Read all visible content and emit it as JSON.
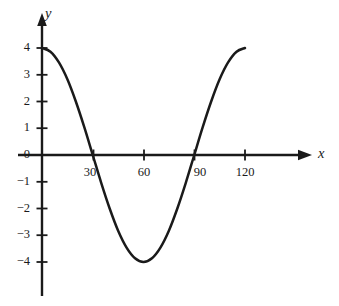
{
  "chart_data": {
    "type": "line",
    "title": "",
    "subtitle": "",
    "xlabel": "x",
    "ylabel": "y",
    "xlim": [
      -5,
      133
    ],
    "ylim": [
      -5.2,
      4.8
    ],
    "grid": false,
    "legend": null,
    "annotations": [],
    "x_ticks": [
      30,
      60,
      90,
      120
    ],
    "x_tick_labels": [
      "30",
      "60",
      "90",
      "120"
    ],
    "y_ticks": [
      4,
      3,
      2,
      1,
      0,
      -1,
      -2,
      -3,
      -4
    ],
    "y_tick_labels": [
      "4",
      "3",
      "2",
      "1",
      "0",
      "−1",
      "−2",
      "−3",
      "−4"
    ],
    "curve_expression": "y = 4 cos(3x)",
    "x": [
      0,
      5,
      10,
      15,
      20,
      25,
      30,
      35,
      40,
      45,
      50,
      55,
      60,
      65,
      70,
      75,
      80,
      85,
      90,
      95,
      100,
      105,
      110,
      115,
      120
    ],
    "values": [
      4.0,
      3.86,
      3.46,
      2.83,
      2.0,
      1.04,
      0.0,
      -1.04,
      -2.0,
      -2.83,
      -3.46,
      -3.86,
      -4.0,
      -3.86,
      -3.46,
      -2.83,
      -2.0,
      -1.04,
      0.0,
      1.04,
      2.0,
      2.83,
      3.46,
      3.86,
      4.0
    ],
    "key_points": {
      "start": [
        0,
        4
      ],
      "first_zero": [
        30,
        0
      ],
      "minimum": [
        60,
        -4
      ],
      "second_zero": [
        90,
        0
      ],
      "end": [
        120,
        4
      ]
    },
    "colors": {
      "curve": "#1a1a1a",
      "axis": "#1a1a1a",
      "background": "#ffffff",
      "text": "#1a1a1a"
    }
  },
  "axes": {
    "x_axis_label": "x",
    "y_axis_label": "y"
  },
  "ticks": {
    "x": [
      {
        "label": "30"
      },
      {
        "label": "60"
      },
      {
        "label": "90"
      },
      {
        "label": "120"
      }
    ],
    "y": [
      {
        "label": "4"
      },
      {
        "label": "3"
      },
      {
        "label": "2"
      },
      {
        "label": "1"
      },
      {
        "label": "0"
      },
      {
        "label": "−1"
      },
      {
        "label": "−2"
      },
      {
        "label": "−3"
      },
      {
        "label": "−4"
      }
    ]
  }
}
